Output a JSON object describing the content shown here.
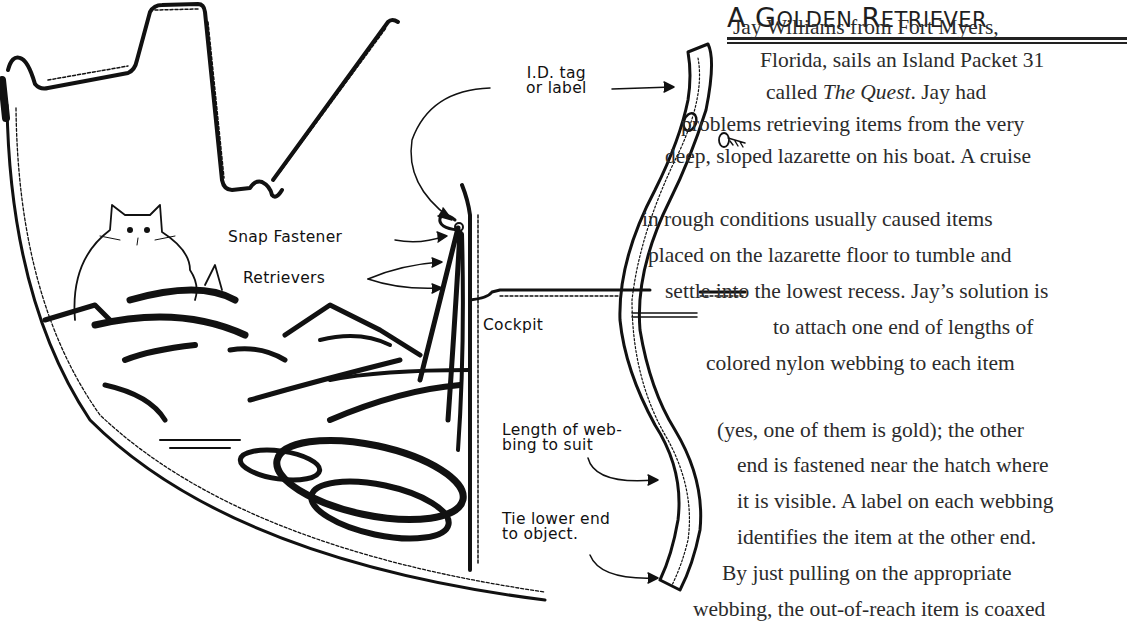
{
  "article": {
    "title_first": "A",
    "title_rest_1_cap": "G",
    "title_rest_1": "OLDEN",
    "title_rest_2_cap": "R",
    "title_rest_2": "ETRIEVER",
    "lines": [
      {
        "pre": "Jay Williams from Fort Myers,",
        "x": 733,
        "y": 14
      },
      {
        "pre": "Florida, sails an Island Packet 31",
        "x": 760,
        "y": 47
      },
      {
        "pre": "called ",
        "italic": "The Quest",
        "post": ". Jay had",
        "x": 766,
        "y": 79
      },
      {
        "pre": "problems retrieving items from the very",
        "x": 681,
        "y": 111
      },
      {
        "pre": "deep, sloped lazarette on his boat. A cruise",
        "x": 665,
        "y": 143
      },
      {
        "pre": "in rough conditions usually caused items",
        "x": 642,
        "y": 206
      },
      {
        "pre": "placed on the lazarette floor to tumble and",
        "x": 648,
        "y": 242
      },
      {
        "pre": "settle into the lowest recess. Jay’s solution is",
        "x": 665,
        "y": 278
      },
      {
        "pre": "to attach one end of lengths of",
        "x": 773,
        "y": 314
      },
      {
        "pre": "colored nylon webbing to each item",
        "x": 706,
        "y": 350
      },
      {
        "pre": "(yes, one of them is gold); the other",
        "x": 717,
        "y": 417
      },
      {
        "pre": "end is fastened near the hatch where",
        "x": 737,
        "y": 452
      },
      {
        "pre": "it is visible. A label on each webbing",
        "x": 737,
        "y": 488
      },
      {
        "pre": "identifies the item at the other end.",
        "x": 737,
        "y": 524
      },
      {
        "pre": "By just pulling on the appropriate",
        "x": 722,
        "y": 560
      },
      {
        "pre": "webbing, the out-of-reach item is coaxed",
        "x": 693,
        "y": 596
      }
    ]
  },
  "diagram": {
    "labels": {
      "id_tag_1": "I.D. tag",
      "id_tag_2": "or label",
      "snap_fastener": "Snap Fastener",
      "retrievers": "Retrievers",
      "cockpit": "Cockpit",
      "length_1": "Length of web-",
      "length_2": "bing to suit",
      "tie_1": "Tie lower end",
      "tie_2": "to object."
    }
  }
}
